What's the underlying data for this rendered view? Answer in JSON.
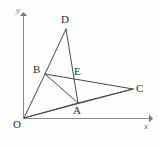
{
  "figure": {
    "background_color": "#fefefe",
    "line_color": "#4a4a4a",
    "axis_color": "#8c8c8c",
    "label_color": "#2f2f2f",
    "axes": {
      "x_label": "x",
      "y_label": "y",
      "origin_label": "O",
      "x_axis": {
        "x1": 24,
        "y1": 118,
        "x2": 150,
        "y2": 118
      },
      "y_axis": {
        "x1": 24,
        "y1": 118,
        "x2": 24,
        "y2": 13
      }
    },
    "points": [
      {
        "name": "O",
        "label": "O",
        "x": 24,
        "y": 118
      },
      {
        "name": "B",
        "label": "B",
        "x": 45,
        "y": 74
      },
      {
        "name": "D",
        "label": "D",
        "x": 66,
        "y": 29
      },
      {
        "name": "E",
        "label": "E",
        "x": 72,
        "y": 76
      },
      {
        "name": "A",
        "label": "A",
        "x": 78,
        "y": 103
      },
      {
        "name": "C",
        "label": "C",
        "x": 133,
        "y": 89
      }
    ],
    "segments": [
      {
        "name": "segment-OB",
        "from": "O",
        "to": "B",
        "path": "M24,118 L45,74"
      },
      {
        "name": "segment-OA",
        "from": "O",
        "to": "A",
        "path": "M24,118 L78,103"
      },
      {
        "name": "segment-OC",
        "from": "O",
        "to": "C",
        "path": "M24,118 L133,89"
      },
      {
        "name": "segment-BD",
        "from": "B",
        "to": "D",
        "path": "M45,74 L66,29"
      },
      {
        "name": "segment-DA",
        "from": "D",
        "to": "A",
        "path": "M66,29 L78,103"
      },
      {
        "name": "segment-BC",
        "from": "B",
        "to": "C",
        "path": "M45,74 L133,89"
      },
      {
        "name": "segment-BA",
        "from": "B",
        "to": "A",
        "path": "M45,74 L78,103"
      },
      {
        "name": "segment-AC",
        "from": "A",
        "to": "C",
        "path": "M78,103 L133,89"
      }
    ]
  }
}
